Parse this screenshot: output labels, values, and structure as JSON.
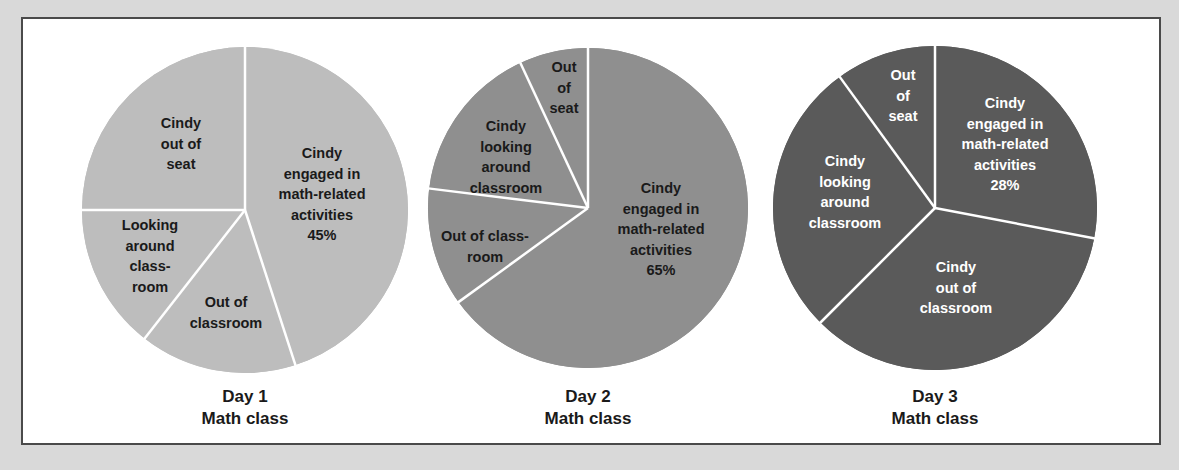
{
  "chart_data": [
    {
      "type": "pie",
      "title": "Day 1 Math class",
      "caption_lines": [
        "Day 1",
        "Math class"
      ],
      "fill_color": "#bdbdbd",
      "text_color": "#1a1a1a",
      "center": [
        245,
        210
      ],
      "radius": 163,
      "slices": [
        {
          "label": "Cindy engaged in math-related activities",
          "value": 45,
          "start_deg": 0,
          "end_deg": 162,
          "label_lines": [
            "Cindy",
            "engaged in",
            "math-related",
            "activities",
            "45%"
          ],
          "label_pos": [
            322,
            158
          ]
        },
        {
          "label": "Out of classroom",
          "value": 15.5,
          "start_deg": 162,
          "end_deg": 218,
          "label_lines": [
            "Out of",
            "classroom"
          ],
          "label_pos": [
            226,
            307
          ]
        },
        {
          "label": "Looking around classroom",
          "value": 14.5,
          "start_deg": 218,
          "end_deg": 270,
          "label_lines": [
            "Looking",
            "around",
            "class-",
            "room"
          ],
          "label_pos": [
            150,
            230
          ]
        },
        {
          "label": "Cindy out of seat",
          "value": 25,
          "start_deg": 270,
          "end_deg": 360,
          "label_lines": [
            "Cindy",
            "out of",
            "seat"
          ],
          "label_pos": [
            181,
            128
          ]
        }
      ]
    },
    {
      "type": "pie",
      "title": "Day 2 Math class",
      "caption_lines": [
        "Day 2",
        "Math class"
      ],
      "fill_color": "#8f8f8f",
      "text_color": "#1a1a1a",
      "center": [
        588,
        208
      ],
      "radius": 160,
      "slices": [
        {
          "label": "Cindy engaged in math-related activities",
          "value": 65,
          "start_deg": 0,
          "end_deg": 234,
          "label_lines": [
            "Cindy",
            "engaged in",
            "math-related",
            "activities",
            "65%"
          ],
          "label_pos": [
            661,
            193
          ]
        },
        {
          "label": "Out of classroom",
          "value": 12,
          "start_deg": 234,
          "end_deg": 277,
          "label_lines": [
            "Out of class-",
            "room"
          ],
          "label_pos": [
            485,
            241
          ]
        },
        {
          "label": "Cindy looking around classroom",
          "value": 16,
          "start_deg": 277,
          "end_deg": 335,
          "label_lines": [
            "Cindy",
            "looking",
            "around",
            "classroom"
          ],
          "label_pos": [
            506,
            131
          ]
        },
        {
          "label": "Out of seat",
          "value": 7,
          "start_deg": 335,
          "end_deg": 360,
          "label_lines": [
            "Out",
            "of",
            "seat"
          ],
          "label_pos": [
            564,
            72
          ]
        }
      ]
    },
    {
      "type": "pie",
      "title": "Day 3 Math class",
      "caption_lines": [
        "Day 3",
        "Math class"
      ],
      "fill_color": "#5a5a5a",
      "text_color": "#ffffff",
      "center": [
        935,
        208
      ],
      "radius": 162,
      "slices": [
        {
          "label": "Cindy engaged in math-related activities",
          "value": 28,
          "start_deg": 0,
          "end_deg": 100.8,
          "label_lines": [
            "Cindy",
            "engaged in",
            "math-related",
            "activities",
            "28%"
          ],
          "label_pos": [
            1005,
            108
          ]
        },
        {
          "label": "Cindy out of classroom",
          "value": 34.5,
          "start_deg": 100.8,
          "end_deg": 225,
          "label_lines": [
            "Cindy",
            "out of",
            "classroom"
          ],
          "label_pos": [
            956,
            272
          ]
        },
        {
          "label": "Cindy looking around classroom",
          "value": 27.5,
          "start_deg": 225,
          "end_deg": 324,
          "label_lines": [
            "Cindy",
            "looking",
            "around",
            "classroom"
          ],
          "label_pos": [
            845,
            166
          ]
        },
        {
          "label": "Out of seat",
          "value": 10,
          "start_deg": 324,
          "end_deg": 360,
          "label_lines": [
            "Out",
            "of",
            "seat"
          ],
          "label_pos": [
            903,
            80
          ]
        }
      ]
    }
  ],
  "colors": {
    "page_background": "#d9d9d9",
    "panel_background": "#ffffff",
    "panel_border": "#4a4a4a",
    "divider": "#ffffff"
  }
}
